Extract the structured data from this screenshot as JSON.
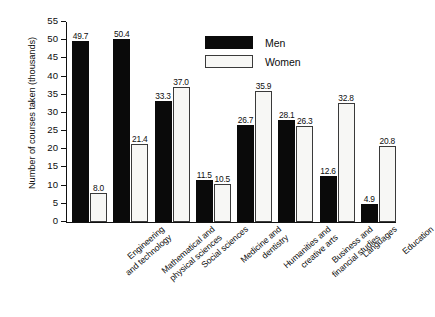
{
  "chart_data": {
    "type": "bar",
    "title": "",
    "subtitle": "",
    "xlabel": "",
    "ylabel": "Number of courses taken (thousands)",
    "ylim": [
      0,
      55
    ],
    "ytick_labels": [
      "55",
      "50",
      "45",
      "40",
      "35",
      "30",
      "25",
      "20",
      "15",
      "10",
      "5",
      "0"
    ],
    "ytick_values": [
      55,
      50,
      45,
      40,
      35,
      30,
      25,
      20,
      15,
      10,
      5,
      0
    ],
    "grid": false,
    "legend_position": "inside-top-center",
    "value_labels": true,
    "categories": [
      "Engineering and technology",
      "Mathematical and physical sciences",
      "Social sciences",
      "Medicine and dentistry",
      "Humanities and creative arts",
      "Business and financial studies",
      "Languages",
      "Education"
    ],
    "category_lines": [
      [
        "Engineering",
        "and technology"
      ],
      [
        "Mathematical and",
        "physical sciences"
      ],
      [
        "Social sciences",
        ""
      ],
      [
        "Medicine and",
        "dentistry"
      ],
      [
        "Humanities and",
        "creative arts"
      ],
      [
        "Business and",
        "financial studies"
      ],
      [
        "Languages",
        ""
      ],
      [
        "Education",
        ""
      ]
    ],
    "series": [
      {
        "name": "Men",
        "color": "#0a0a0a",
        "values": [
          49.7,
          50.4,
          33.3,
          11.5,
          26.7,
          28.1,
          12.6,
          4.9
        ],
        "value_labels": [
          "49.7",
          "50.4",
          "33.3",
          "11.5",
          "26.7",
          "28.1",
          "12.6",
          "4.9"
        ]
      },
      {
        "name": "Women",
        "color": "#f7f7f5",
        "values": [
          8.0,
          21.4,
          37.0,
          10.5,
          35.9,
          26.3,
          32.8,
          20.8
        ],
        "value_labels": [
          "8.0",
          "21.4",
          "37.0",
          "10.5",
          "35.9",
          "26.3",
          "32.8",
          "20.8"
        ]
      }
    ]
  },
  "legend": {
    "items": [
      {
        "label": "Men",
        "swatch": "men"
      },
      {
        "label": "Women",
        "swatch": "women"
      }
    ]
  }
}
